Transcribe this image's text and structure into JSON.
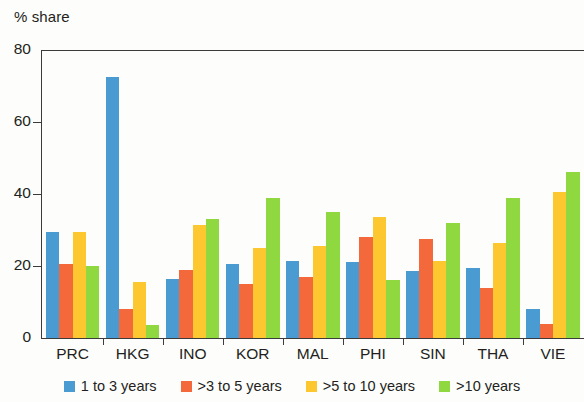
{
  "chart_data": {
    "type": "bar",
    "title": "",
    "ylabel": "% share",
    "xlabel": "",
    "ylim": [
      0,
      80
    ],
    "yticks": [
      0,
      20,
      40,
      60,
      80
    ],
    "grid": false,
    "legend_position": "bottom",
    "categories": [
      "PRC",
      "HKG",
      "INO",
      "KOR",
      "MAL",
      "PHI",
      "SIN",
      "THA",
      "VIE"
    ],
    "series": [
      {
        "name": "1 to 3 years",
        "color": "#4A9BD1",
        "values": [
          29.5,
          72.5,
          16.5,
          20.5,
          21.5,
          21.0,
          18.5,
          19.5,
          8.0
        ]
      },
      {
        "name": ">3 to 5 years",
        "color": "#F4693C",
        "values": [
          20.5,
          8.0,
          19.0,
          15.0,
          17.0,
          28.0,
          27.5,
          14.0,
          4.0
        ]
      },
      {
        "name": ">5 to 10 years",
        "color": "#FDC82F",
        "values": [
          29.5,
          15.5,
          31.5,
          25.0,
          25.5,
          33.5,
          21.5,
          26.5,
          40.5
        ]
      },
      {
        "name": ">10 years",
        "color": "#8FD840",
        "values": [
          20.0,
          3.5,
          33.0,
          39.0,
          35.0,
          16.0,
          32.0,
          39.0,
          46.0
        ]
      }
    ]
  },
  "axis": {
    "y_title": "% share",
    "y_tick_labels": [
      "80",
      "60",
      "40",
      "20",
      "0"
    ]
  },
  "legend": {
    "items": [
      {
        "label": "1 to 3 years",
        "color": "#4A9BD1"
      },
      {
        "label": ">3 to 5 years",
        "color": "#F4693C"
      },
      {
        "label": ">5 to 10 years",
        "color": "#FDC82F"
      },
      {
        "label": ">10 years",
        "color": "#8FD840"
      }
    ]
  }
}
